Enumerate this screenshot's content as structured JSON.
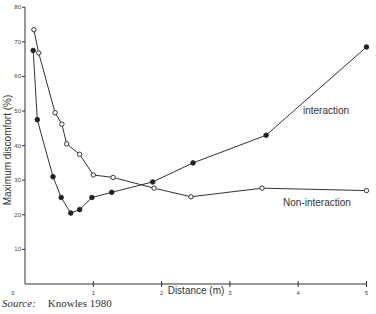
{
  "chart_data": {
    "type": "line",
    "title": "",
    "xlabel": "Distance (m)",
    "ylabel": "Maximum discomfort (%)",
    "xlim": [
      0,
      5
    ],
    "ylim": [
      0,
      80
    ],
    "xticks": [
      "0",
      "1",
      "2",
      "3",
      "4",
      "5"
    ],
    "yticks": [
      "10",
      "20",
      "30",
      "40",
      "50",
      "60",
      "70",
      "80"
    ],
    "grid": false,
    "legend": "inline labels",
    "series": [
      {
        "name": "interaction",
        "marker": "filled-circle",
        "x": [
          0.12,
          0.18,
          0.41,
          0.53,
          0.67,
          0.8,
          0.98,
          1.27,
          1.87,
          2.46,
          3.53,
          5.0
        ],
        "y": [
          67.5,
          47.5,
          31,
          25,
          20.5,
          21.5,
          25,
          26.5,
          29.5,
          35,
          43,
          68.5
        ]
      },
      {
        "name": "Non-interaction",
        "marker": "open-circle",
        "x": [
          0.13,
          0.2,
          0.44,
          0.54,
          0.61,
          0.8,
          1.0,
          1.29,
          1.89,
          2.43,
          3.47,
          5.0
        ],
        "y": [
          73.5,
          66.8,
          49.5,
          46.2,
          40.5,
          37.5,
          31.5,
          30.8,
          27.7,
          25.2,
          27.7,
          27
        ]
      }
    ],
    "annotations": [
      "interaction",
      "Non-interaction"
    ]
  },
  "source": {
    "label": "Source:",
    "text": "Knowles 1980"
  }
}
